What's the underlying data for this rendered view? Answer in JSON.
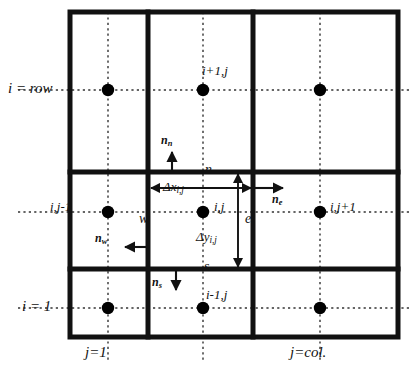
{
  "figure": {
    "kind": "finite-volume-grid-diagram",
    "background_color": "#ffffff",
    "line_color": "#111111",
    "node_color": "#000000"
  },
  "axis_labels": {
    "row_top": "i = row",
    "row_bottom": "i = 1",
    "col_left": "j=1",
    "col_right": "j=col."
  },
  "node_labels": {
    "north": "i+1,j",
    "west": "i,j-1",
    "center": "i,j",
    "east": "i,j+1",
    "south": "i-1,j"
  },
  "face_labels": {
    "n": "n",
    "s": "s",
    "w": "w",
    "e": "e"
  },
  "normals": [
    {
      "id": "n-north",
      "base": "n",
      "subscript": "n",
      "direction": "up"
    },
    {
      "id": "n-south",
      "base": "n",
      "subscript": "s",
      "direction": "down"
    },
    {
      "id": "n-west",
      "base": "n",
      "subscript": "w",
      "direction": "left"
    },
    {
      "id": "n-east",
      "base": "n",
      "subscript": "e",
      "direction": "right"
    }
  ],
  "dimensions": {
    "dx": {
      "symbol": "Δx",
      "subscript": "i,j"
    },
    "dy": {
      "symbol": "Δy",
      "subscript": "i,j"
    }
  },
  "grid": {
    "outer_border": {
      "x": 70,
      "y": 12,
      "width": 328,
      "height": 325
    },
    "vertical_dividers_x": [
      148,
      253
    ],
    "horizontal_dividers_y": [
      172,
      269
    ],
    "dotted_columns_x": [
      108,
      203,
      320
    ],
    "dotted_rows_y": [
      90,
      212,
      308
    ],
    "nodes": [
      {
        "x": 108,
        "y": 90
      },
      {
        "x": 203,
        "y": 90
      },
      {
        "x": 320,
        "y": 90
      },
      {
        "x": 108,
        "y": 212
      },
      {
        "x": 203,
        "y": 212
      },
      {
        "x": 320,
        "y": 212
      },
      {
        "x": 108,
        "y": 308
      },
      {
        "x": 203,
        "y": 308
      },
      {
        "x": 320,
        "y": 308
      }
    ]
  }
}
